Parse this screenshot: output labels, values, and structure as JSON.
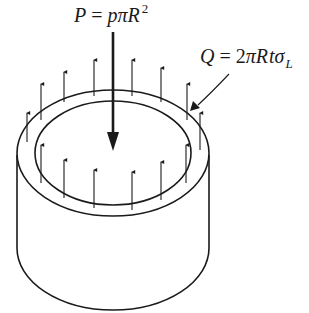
{
  "figure": {
    "load_label": {
      "lhs": "P",
      "eq": " = ",
      "rhs_p": "p",
      "rhs_pi": "π",
      "rhs_R": "R",
      "exp": "2"
    },
    "wall_label": {
      "lhs": "Q",
      "eq": " = ",
      "two": "2",
      "pi": "π",
      "R": "R",
      "t": "t",
      "sigma": "σ",
      "sub": "L"
    },
    "colors": {
      "stroke": "#1a1a1a",
      "background": "#ffffff"
    },
    "elements": {
      "central_load_arrow": "downward",
      "wall_stress_arrows": "upward",
      "outer_ring_arrow_count": 9,
      "inner_ring_arrow_count": 7
    }
  }
}
